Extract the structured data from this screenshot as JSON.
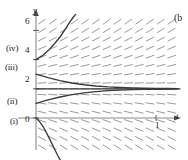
{
  "figure": {
    "panel_label": ")",
    "panel_label_full": "(a)",
    "next_panel_label": "(b"
  },
  "axes": {
    "y_axis_label": "y",
    "t_axis_label": "t",
    "y_ticks": [
      {
        "value": 6,
        "label": "6"
      },
      {
        "value": 4,
        "label": "4"
      },
      {
        "value": 2,
        "label": "2"
      },
      {
        "value": 0,
        "label": "0"
      }
    ],
    "t_ticks": [
      {
        "value": 1,
        "label": "1"
      }
    ],
    "xlim": [
      -0.12,
      1.2
    ],
    "ylim": [
      -2.2,
      7.0
    ]
  },
  "curve_labels": [
    {
      "id": "i",
      "label": "(i)"
    },
    {
      "id": "ii",
      "label": "(ii)"
    },
    {
      "id": "iii",
      "label": "(iii)"
    },
    {
      "id": "iv",
      "label": "(iv)"
    }
  ],
  "colors": {
    "slope_field": "#8f8f8f",
    "curve": "#3a3a3a",
    "axis": "#6e6e6e",
    "text": "#1d1d1d",
    "background": "#ffffff"
  },
  "chart_data": {
    "type": "line",
    "title": "",
    "subtitle": "",
    "xlabel": "t",
    "ylabel": "y",
    "xlim": [
      -0.12,
      1.2
    ],
    "ylim": [
      -2.2,
      7.0
    ],
    "grid": false,
    "legend_position": "left-margin",
    "equilibrium": {
      "value": 2,
      "label": "y = 2",
      "stable": true
    },
    "slope_field": {
      "description": "direction field for dy/dt with equilibrium at y=2; slopes positive below y=2 and increasing away above y=2",
      "t_samples": [
        0.05,
        0.14,
        0.23,
        0.32,
        0.41,
        0.5,
        0.59,
        0.68,
        0.77,
        0.86,
        0.95,
        1.04,
        1.13
      ],
      "y_samples": [
        -2.0,
        -1.4,
        -0.8,
        -0.2,
        0.4,
        1.0,
        1.6,
        2.0,
        2.4,
        3.0,
        3.6,
        4.2,
        4.8,
        5.4,
        6.0,
        6.6
      ],
      "slope_rule": "proportional to (y - 2)"
    },
    "series": [
      {
        "name": "(i)",
        "label": "(i)",
        "initial_condition": {
          "t": 0,
          "y": 0
        },
        "x": [
          0.0,
          0.03,
          0.06,
          0.09,
          0.12,
          0.15,
          0.18,
          0.21,
          0.24
        ],
        "values": [
          0.0,
          -0.25,
          -0.6,
          -1.05,
          -1.55,
          -2.05,
          -2.55,
          -3.0,
          -3.4
        ],
        "behavior": "diverges downward"
      },
      {
        "name": "(ii)",
        "label": "(ii)",
        "initial_condition": {
          "t": 0,
          "y": 1.0
        },
        "x": [
          0.0,
          0.1,
          0.2,
          0.3,
          0.4,
          0.5,
          0.6,
          0.7,
          0.8,
          0.9,
          1.0,
          1.1,
          1.18
        ],
        "values": [
          1.0,
          1.24,
          1.44,
          1.6,
          1.72,
          1.81,
          1.87,
          1.91,
          1.94,
          1.96,
          1.97,
          1.98,
          1.99
        ],
        "behavior": "converges upward to y = 2"
      },
      {
        "name": "(iii)",
        "label": "(iii)",
        "initial_condition": {
          "t": 0,
          "y": 3.0
        },
        "x": [
          0.0,
          0.1,
          0.2,
          0.3,
          0.4,
          0.5,
          0.6,
          0.7,
          0.8,
          0.9,
          1.0,
          1.1,
          1.18
        ],
        "values": [
          3.0,
          2.76,
          2.56,
          2.4,
          2.28,
          2.19,
          2.13,
          2.09,
          2.06,
          2.04,
          2.03,
          2.02,
          2.01
        ],
        "behavior": "converges downward to y = 2"
      },
      {
        "name": "(iv)",
        "label": "(iv)",
        "initial_condition": {
          "t": 0,
          "y": 4.0
        },
        "x": [
          0.0,
          0.05,
          0.1,
          0.15,
          0.2,
          0.25,
          0.28,
          0.31,
          0.33
        ],
        "values": [
          4.0,
          4.25,
          4.6,
          5.05,
          5.55,
          6.15,
          6.55,
          6.9,
          7.1
        ],
        "behavior": "diverges upward"
      }
    ]
  }
}
